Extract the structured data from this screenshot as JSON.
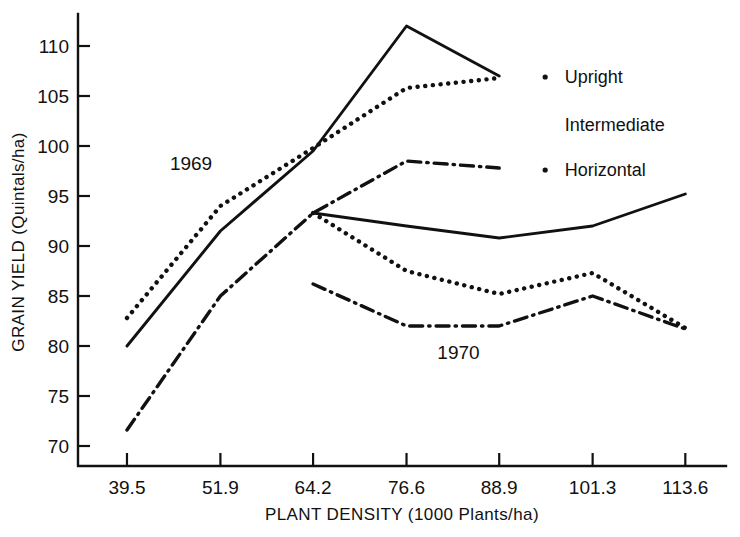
{
  "chart_data": {
    "type": "line",
    "title": "",
    "xlabel": "PLANT DENSITY (1000 Plants/ha)",
    "ylabel": "GRAIN YIELD (Quintals/ha)",
    "xlim": [
      33.0,
      119.0
    ],
    "ylim": [
      68.0,
      112.8
    ],
    "grid": false,
    "legend_position": "right-inline",
    "x_ticks": [
      39.5,
      51.9,
      64.2,
      76.6,
      88.9,
      101.3,
      113.6
    ],
    "x_tick_labels": [
      "39.5",
      "51.9",
      "64.2",
      "76.6",
      "88.9",
      "101.3",
      "113.6"
    ],
    "y_ticks": [
      70,
      75,
      80,
      85,
      90,
      95,
      100,
      105,
      110
    ],
    "y_tick_labels": [
      "70",
      "75",
      "80",
      "85",
      "90",
      "95",
      "100",
      "105",
      "110"
    ],
    "annotations": [
      {
        "text": "1969",
        "x": 48.0,
        "y": 97.6
      },
      {
        "text": "1970",
        "x": 83.5,
        "y": 78.7
      }
    ],
    "legend_entries": [
      {
        "label": "Upright",
        "style": "solid"
      },
      {
        "label": "Intermediate",
        "style": "dotted"
      },
      {
        "label": "Horizontal",
        "style": "dash-dot"
      }
    ],
    "series": [
      {
        "name": "Upright",
        "year": "1969",
        "style": "solid",
        "x": [
          39.5,
          51.9,
          64.2,
          76.6,
          88.9
        ],
        "values": [
          80.0,
          91.5,
          99.5,
          112.0,
          107.0
        ]
      },
      {
        "name": "Intermediate",
        "year": "1969",
        "style": "dotted",
        "x": [
          39.5,
          51.9,
          64.2,
          76.6,
          88.9
        ],
        "values": [
          82.8,
          94.0,
          99.8,
          105.8,
          106.8
        ]
      },
      {
        "name": "Horizontal",
        "year": "1969",
        "style": "dash-dot",
        "x": [
          39.5,
          51.9,
          64.2,
          76.6,
          88.9
        ],
        "values": [
          71.6,
          85.0,
          93.3,
          98.5,
          97.8
        ]
      },
      {
        "name": "Upright",
        "year": "1970",
        "style": "solid",
        "x": [
          64.2,
          76.6,
          88.9,
          101.3,
          113.6
        ],
        "values": [
          93.3,
          92.0,
          90.8,
          92.0,
          95.2
        ]
      },
      {
        "name": "Intermediate",
        "year": "1970",
        "style": "dotted",
        "x": [
          64.2,
          76.6,
          88.9,
          101.3,
          113.6
        ],
        "values": [
          93.3,
          87.5,
          85.2,
          87.3,
          81.8
        ]
      },
      {
        "name": "Horizontal",
        "year": "1970",
        "style": "dash-dot",
        "x": [
          64.2,
          76.6,
          88.9,
          101.3,
          113.6
        ],
        "values": [
          86.2,
          82.0,
          82.0,
          85.0,
          81.7
        ]
      }
    ]
  }
}
